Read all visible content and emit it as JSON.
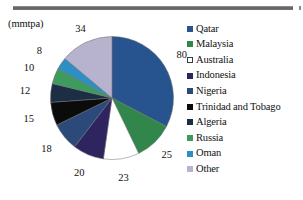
{
  "unit_caption": "(mmtpa)",
  "decorations": {
    "top_rule": "horizontal-rule",
    "right_tick": "right-edge-tick"
  },
  "chart_data": {
    "type": "pie",
    "title": "",
    "subtitle": "",
    "xlabel": "",
    "ylabel": "",
    "unit": "mmtpa",
    "legend_position": "right",
    "grid": false,
    "total": 245,
    "categories": [
      "Qatar",
      "Malaysia",
      "Australia",
      "Indonesia",
      "Nigeria",
      "Trinidad and Tobago",
      "Algeria",
      "Russia",
      "Oman",
      "Other"
    ],
    "values": [
      80,
      25,
      23,
      20,
      18,
      15,
      12,
      10,
      8,
      34
    ],
    "colors": [
      "#27538F",
      "#31874B",
      "#FFFFFF",
      "#2E2460",
      "#2B4A7A",
      "#0B0B0B",
      "#1B2E46",
      "#3E9B5E",
      "#2E8FC4",
      "#B7B2CE"
    ],
    "data_labels": [
      "80",
      "25",
      "23",
      "20",
      "18",
      "15",
      "12",
      "10",
      "8",
      "34"
    ]
  },
  "legend": {
    "items": [
      {
        "label": "Qatar",
        "color": "#27538F"
      },
      {
        "label": "Malaysia",
        "color": "#31874B"
      },
      {
        "label": "Australia",
        "color": "#FFFFFF"
      },
      {
        "label": "Indonesia",
        "color": "#2E2460"
      },
      {
        "label": "Nigeria",
        "color": "#2B4A7A"
      },
      {
        "label": "Trinidad and Tobago",
        "color": "#0B0B0B"
      },
      {
        "label": "Algeria",
        "color": "#1B2E46"
      },
      {
        "label": "Russia",
        "color": "#3E9B5E"
      },
      {
        "label": "Oman",
        "color": "#2E8FC4"
      },
      {
        "label": "Other",
        "color": "#B7B2CE"
      }
    ]
  }
}
